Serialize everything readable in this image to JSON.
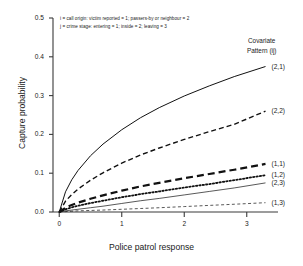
{
  "chart_data": {
    "type": "line",
    "title": "",
    "xlabel": "Police patrol response",
    "ylabel": "Capture probability",
    "xlim": [
      -0.1,
      3.5
    ],
    "ylim": [
      0.0,
      0.5
    ],
    "xticks": [
      "0",
      "1",
      "2",
      "3"
    ],
    "xtick_values": [
      0,
      1,
      2,
      3
    ],
    "yticks": [
      "0.0",
      "0.1",
      "0.2",
      "0.3",
      "0.4",
      "0.5"
    ],
    "ytick_values": [
      0.0,
      0.1,
      0.2,
      0.3,
      0.4,
      0.5
    ],
    "grid": false,
    "legend_position": "right-outside",
    "legend_title_line1": "Covariate",
    "legend_title_line2": "Pattern (ij)",
    "annotations": [
      "i = call origin: victim reported = 1; passers-by or neighbour = 2",
      "j = crime stage: entering = 1; inside = 2; leaving = 3"
    ],
    "x": [
      0,
      0.1,
      0.2,
      0.3,
      0.5,
      0.7,
      1.0,
      1.3,
      1.6,
      2.0,
      2.4,
      2.8,
      3.3
    ],
    "series": [
      {
        "name": "(2,1)",
        "label": "(2,1)",
        "style": "solid",
        "width": 1.0,
        "values": [
          0.0,
          0.052,
          0.083,
          0.107,
          0.145,
          0.175,
          0.212,
          0.243,
          0.269,
          0.299,
          0.325,
          0.349,
          0.375
        ]
      },
      {
        "name": "(2,2)",
        "label": "(2,2)",
        "style": "dashed",
        "width": 1.4,
        "values": [
          0.0,
          0.028,
          0.045,
          0.059,
          0.082,
          0.101,
          0.126,
          0.147,
          0.165,
          0.187,
          0.207,
          0.226,
          0.26
        ]
      },
      {
        "name": "(1,1)",
        "label": "(1,1)",
        "style": "long-dash",
        "width": 2.2,
        "values": [
          0.0,
          0.011,
          0.018,
          0.024,
          0.034,
          0.043,
          0.055,
          0.066,
          0.075,
          0.087,
          0.098,
          0.109,
          0.124
        ]
      },
      {
        "name": "(1,2)",
        "label": "(1,2)",
        "style": "dotted",
        "width": 1.8,
        "values": [
          0.0,
          0.007,
          0.012,
          0.016,
          0.023,
          0.029,
          0.038,
          0.046,
          0.053,
          0.063,
          0.072,
          0.082,
          0.095
        ]
      },
      {
        "name": "(2,3)",
        "label": "(2,3)",
        "style": "solid",
        "width": 0.7,
        "values": [
          0.0,
          0.003,
          0.005,
          0.007,
          0.011,
          0.015,
          0.022,
          0.029,
          0.035,
          0.044,
          0.053,
          0.062,
          0.075
        ]
      },
      {
        "name": "(1,3)",
        "label": "(1,3)",
        "style": "short-dash",
        "width": 0.7,
        "values": [
          0.0,
          0.001,
          0.002,
          0.003,
          0.004,
          0.005,
          0.007,
          0.009,
          0.011,
          0.014,
          0.017,
          0.02,
          0.024
        ]
      }
    ]
  }
}
